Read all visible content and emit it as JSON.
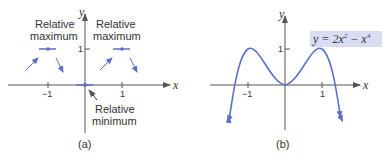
{
  "panel_a": {
    "caption": "(a)",
    "x_axis_label": "x",
    "y_axis_label": "y",
    "x_ticks": [
      "−1",
      "1"
    ],
    "y_ticks": [
      "1"
    ],
    "annotations": {
      "left_max_line1": "Relative",
      "left_max_line2": "maximum",
      "right_max_line1": "Relative",
      "right_max_line2": "maximum",
      "min_line1": "Relative",
      "min_line2": "minimum"
    }
  },
  "panel_b": {
    "caption": "(b)",
    "x_axis_label": "x",
    "y_axis_label": "y",
    "x_ticks": [
      "−1",
      "1"
    ],
    "y_ticks": [
      "1"
    ],
    "equation": {
      "lhs": "y = 2x",
      "exp1": "2",
      "mid": " − x",
      "exp2": "4"
    }
  },
  "colors": {
    "curve": "#5a6fc8",
    "axis": "#555555",
    "label_box": "#d9ddf3",
    "text": "#333333"
  }
}
